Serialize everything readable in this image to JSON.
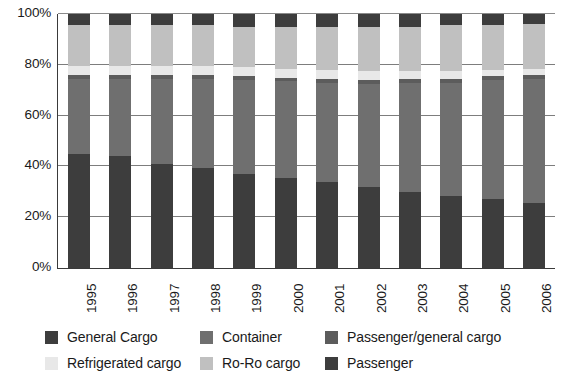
{
  "chart_data": {
    "type": "bar",
    "subtype": "stacked-bar-100-percent",
    "title": "",
    "xlabel": "",
    "ylabel": "",
    "ylim": [
      0,
      100
    ],
    "yticks": [
      0,
      20,
      40,
      60,
      80,
      100
    ],
    "ytick_labels": [
      "0%",
      "20%",
      "40%",
      "60%",
      "80%",
      "100%"
    ],
    "grid": true,
    "legend_position": "bottom",
    "stack_order_bottom_to_top": [
      "General Cargo",
      "Container",
      "Passenger/general cargo",
      "Refrigerated cargo",
      "Ro-Ro cargo",
      "Passenger"
    ],
    "categories": [
      "1995",
      "1996",
      "1997",
      "1998",
      "1999",
      "2000",
      "2001",
      "2002",
      "2003",
      "2004",
      "2005",
      "2006"
    ],
    "series": [
      {
        "name": "General Cargo",
        "color": "#3d3d3d",
        "values": [
          45,
          44,
          41,
          39.5,
          37,
          35.5,
          34,
          32,
          30,
          28.5,
          27,
          25.5
        ]
      },
      {
        "name": "Container",
        "color": "#6f6f6f",
        "values": [
          29.5,
          30.5,
          33.5,
          35,
          37,
          38,
          39,
          40.5,
          43,
          44.5,
          47,
          49
        ]
      },
      {
        "name": "Passenger/general cargo",
        "color": "#5c5c5c",
        "values": [
          1.5,
          1.5,
          1.5,
          1.5,
          1.5,
          1.5,
          1.5,
          1.5,
          1.5,
          1.5,
          1.5,
          1.5
        ]
      },
      {
        "name": "Refrigerated cargo",
        "color": "#e8e8e8",
        "values": [
          3.5,
          3.5,
          3.5,
          3.5,
          3.5,
          3.5,
          3.5,
          3.5,
          3,
          3,
          2.5,
          2.5
        ]
      },
      {
        "name": "Ro-Ro cargo",
        "color": "#c0c0c0",
        "values": [
          16,
          16,
          16,
          16,
          16,
          16.5,
          17,
          17.5,
          17.5,
          18,
          17.5,
          17.5
        ]
      },
      {
        "name": "Passenger",
        "color": "#3d3d3d",
        "values": [
          4.5,
          4.5,
          4.5,
          4.5,
          5,
          5,
          5,
          5,
          5,
          4.5,
          4.5,
          4
        ]
      }
    ]
  },
  "legend": {
    "items": [
      {
        "label": "General Cargo",
        "color": "#3d3d3d"
      },
      {
        "label": "Container",
        "color": "#6f6f6f"
      },
      {
        "label": "Passenger/general cargo",
        "color": "#5c5c5c"
      },
      {
        "label": "Refrigerated cargo",
        "color": "#e8e8e8"
      },
      {
        "label": "Ro-Ro cargo",
        "color": "#c0c0c0"
      },
      {
        "label": "Passenger",
        "color": "#3d3d3d"
      }
    ]
  },
  "axes": {
    "plot_background": "#ffffff",
    "axis_color": "#3a3a3a",
    "grid_color": "#7d7d7d"
  }
}
